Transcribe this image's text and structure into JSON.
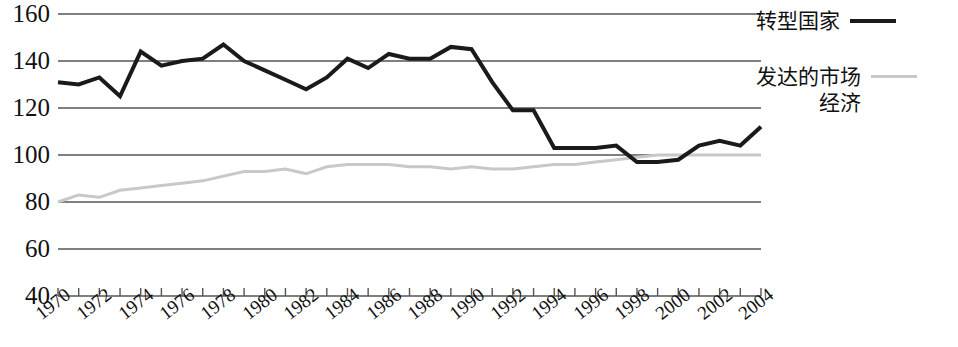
{
  "chart_data": {
    "type": "line",
    "title": "",
    "subtitle": "",
    "xlabel": "",
    "ylabel": "",
    "xlim": [
      1970,
      2004
    ],
    "ylim": [
      40,
      160
    ],
    "yticks": [
      40,
      60,
      80,
      100,
      120,
      140,
      160
    ],
    "ytick_labels": [
      "40",
      "60",
      "80",
      "100",
      "120",
      "140",
      "160"
    ],
    "grid": true,
    "grid_axis": "y",
    "legend_position": "right",
    "x": [
      1970,
      1971,
      1972,
      1973,
      1974,
      1975,
      1976,
      1977,
      1978,
      1979,
      1980,
      1981,
      1982,
      1983,
      1984,
      1985,
      1986,
      1987,
      1988,
      1989,
      1990,
      1991,
      1992,
      1993,
      1994,
      1995,
      1996,
      1997,
      1998,
      1999,
      2000,
      2001,
      2002,
      2003,
      2004
    ],
    "xticks": [
      1970,
      1971,
      1972,
      1973,
      1974,
      1975,
      1976,
      1977,
      1978,
      1979,
      1980,
      1981,
      1982,
      1983,
      1984,
      1985,
      1986,
      1987,
      1988,
      1989,
      1990,
      1991,
      1992,
      1993,
      1994,
      1995,
      1996,
      1997,
      1998,
      1999,
      2000,
      2001,
      2002,
      2003,
      2004
    ],
    "xtick_labels": [
      "1970",
      "",
      "1972",
      "",
      "1974",
      "",
      "1976",
      "",
      "1978",
      "",
      "1980",
      "",
      "1982",
      "",
      "1984",
      "",
      "1986",
      "",
      "1988",
      "",
      "1990",
      "",
      "1992",
      "",
      "1994",
      "",
      "1996",
      "",
      "1998",
      "",
      "2000",
      "",
      "2002",
      "",
      "2004"
    ],
    "series": [
      {
        "name": "转型国家",
        "color": "#1a1a1a",
        "width": 4,
        "values": [
          131,
          130,
          133,
          125,
          144,
          138,
          140,
          141,
          147,
          140,
          136,
          132,
          128,
          133,
          141,
          137,
          143,
          141,
          141,
          146,
          145,
          131,
          119,
          119,
          103,
          103,
          103,
          104,
          97,
          97,
          98,
          104,
          106,
          104,
          112
        ]
      },
      {
        "name": "发达的市场经济",
        "color": "#c8c8c8",
        "width": 3,
        "values": [
          80,
          83,
          82,
          85,
          86,
          87,
          88,
          89,
          91,
          93,
          93,
          94,
          92,
          95,
          96,
          96,
          96,
          95,
          95,
          94,
          95,
          94,
          94,
          95,
          96,
          96,
          97,
          98,
          99,
          100,
          100,
          100,
          100,
          100,
          100
        ]
      }
    ]
  },
  "legend": {
    "entries": [
      {
        "label": "转型国家",
        "swatch": "dark-line-swatch"
      },
      {
        "label": "发达的市场\n经济",
        "swatch": "light-line-swatch"
      }
    ],
    "entry_0_label": "转型国家",
    "entry_1_label_line1": "发达的市场",
    "entry_1_label_line2": "经济"
  },
  "colors": {
    "axis": "#555555",
    "grid": "#555555",
    "series_transition": "#1a1a1a",
    "series_developed": "#c8c8c8",
    "background": "#ffffff",
    "text": "#111111"
  }
}
